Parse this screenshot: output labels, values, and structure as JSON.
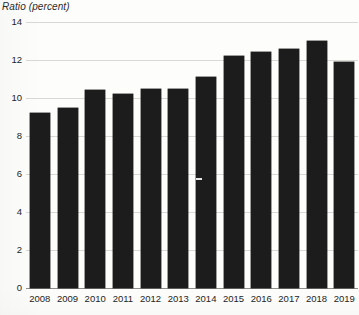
{
  "chart_data": {
    "type": "bar",
    "title": "",
    "ylabel": "Ratio (percent)",
    "xlabel": "",
    "categories": [
      "2008",
      "2009",
      "2010",
      "2011",
      "2012",
      "2013",
      "2014",
      "2015",
      "2016",
      "2017",
      "2018",
      "2019"
    ],
    "values": [
      9.2,
      9.5,
      10.4,
      10.2,
      10.5,
      10.5,
      11.1,
      12.2,
      12.4,
      12.6,
      13.0,
      11.9
    ],
    "yticks": [
      "0",
      "2",
      "4",
      "6",
      "8",
      "10",
      "12",
      "14"
    ],
    "ytick_values": [
      0,
      2,
      4,
      6,
      8,
      10,
      12,
      14
    ],
    "ylim": [
      0,
      14
    ],
    "grid": true,
    "legend": "none",
    "bar_color": "#1c1c1c",
    "gridline_color": "#d8d8d4",
    "axis_color": "#8e8e8a"
  }
}
